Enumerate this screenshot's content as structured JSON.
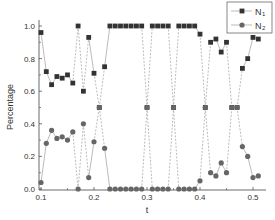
{
  "chart_data": {
    "type": "line",
    "title": "",
    "xlabel": "t",
    "ylabel": "Percentage",
    "xlim": [
      0.1,
      0.52
    ],
    "ylim": [
      0.0,
      1.0
    ],
    "xticks": [
      "0.1",
      "0.2",
      "0.3",
      "0.4",
      "0.5"
    ],
    "yticks": [
      "0.0",
      "0.2",
      "0.4",
      "0.6",
      "0.8",
      "1.0"
    ],
    "grid": false,
    "legend_position": "upper right",
    "x": [
      0.1,
      0.11,
      0.12,
      0.13,
      0.14,
      0.15,
      0.16,
      0.17,
      0.18,
      0.19,
      0.2,
      0.21,
      0.22,
      0.23,
      0.24,
      0.25,
      0.26,
      0.27,
      0.28,
      0.29,
      0.3,
      0.31,
      0.32,
      0.33,
      0.34,
      0.35,
      0.36,
      0.37,
      0.38,
      0.39,
      0.4,
      0.41,
      0.42,
      0.43,
      0.44,
      0.45,
      0.46,
      0.47,
      0.48,
      0.49,
      0.5,
      0.51
    ],
    "series": [
      {
        "name": "N1",
        "label_main": "N",
        "label_sub": "1",
        "marker": "square",
        "color": "#333333",
        "values": [
          0.96,
          0.72,
          0.64,
          0.69,
          0.68,
          0.7,
          0.65,
          1.0,
          0.6,
          0.93,
          0.71,
          0.5,
          0.75,
          1.0,
          1.0,
          1.0,
          1.0,
          1.0,
          1.0,
          1.0,
          0.5,
          1.0,
          1.0,
          1.0,
          1.0,
          0.5,
          1.0,
          1.0,
          1.0,
          1.0,
          0.95,
          0.5,
          0.9,
          0.92,
          0.84,
          0.9,
          0.5,
          0.5,
          0.74,
          0.8,
          0.93,
          0.92
        ]
      },
      {
        "name": "N2",
        "label_main": "N",
        "label_sub": "2",
        "marker": "circle",
        "color": "#666666",
        "values": [
          0.04,
          0.28,
          0.36,
          0.31,
          0.32,
          0.3,
          0.35,
          0.0,
          0.4,
          0.07,
          0.29,
          0.5,
          0.25,
          0.0,
          0.0,
          0.0,
          0.0,
          0.0,
          0.0,
          0.0,
          0.5,
          0.0,
          0.0,
          0.0,
          0.0,
          0.5,
          0.0,
          0.0,
          0.0,
          0.0,
          0.05,
          0.5,
          0.1,
          0.08,
          0.16,
          0.1,
          0.5,
          0.5,
          0.26,
          0.2,
          0.07,
          0.08
        ]
      }
    ]
  }
}
